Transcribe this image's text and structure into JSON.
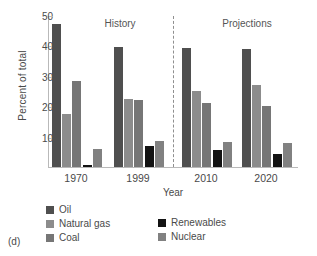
{
  "panel": {
    "caption": "(d)"
  },
  "chart_data": {
    "type": "bar",
    "title": "",
    "xlabel": "Year",
    "ylabel": "Percent of total",
    "categories": [
      "1970",
      "1999",
      "2010",
      "2020"
    ],
    "ylim": [
      0,
      50
    ],
    "yticks": [
      10,
      20,
      30,
      40,
      50
    ],
    "grid": false,
    "legend_position": "below-axes",
    "annotations": [
      {
        "text": "History",
        "x_category_span": [
          "1970",
          "1999"
        ]
      },
      {
        "text": "Projections",
        "x_category_span": [
          "2010",
          "2020"
        ]
      },
      {
        "text": "divider",
        "type": "dashed-vertical-line",
        "between": [
          "1999",
          "2010"
        ]
      }
    ],
    "series": [
      {
        "name": "Oil",
        "color": "#4f4f4f",
        "values": [
          47,
          39.5,
          39.2,
          38.8
        ]
      },
      {
        "name": "Natural gas",
        "color": "#8c8c8c",
        "values": [
          17.4,
          22.5,
          25,
          27
        ]
      },
      {
        "name": "Coal",
        "color": "#767676",
        "values": [
          28.4,
          22,
          21,
          20
        ]
      },
      {
        "name": "Renewables",
        "color": "#131313",
        "values": [
          0.7,
          6.8,
          5.7,
          4.3
        ]
      },
      {
        "name": "Nuclear",
        "color": "#818181",
        "values": [
          6,
          8.5,
          8.3,
          8
        ]
      }
    ]
  }
}
